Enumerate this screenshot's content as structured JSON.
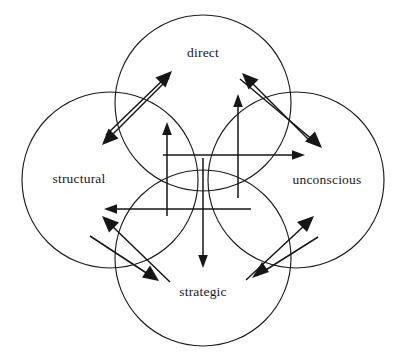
{
  "diagram": {
    "background_color": "#ffffff",
    "stroke_color": "#1c1c1c",
    "arrow_color": "#161616",
    "label_color": "#20201e",
    "circles": [
      {
        "id": "top",
        "label": "direct",
        "cx": 203,
        "cy": 103,
        "r": 88,
        "label_x": 203,
        "label_y": 54
      },
      {
        "id": "left",
        "label": "structural",
        "cx": 110,
        "cy": 180,
        "r": 88,
        "label_x": 79,
        "label_y": 180
      },
      {
        "id": "right",
        "label": "unconscious",
        "cx": 296,
        "cy": 180,
        "r": 88,
        "label_x": 327,
        "label_y": 181
      },
      {
        "id": "bottom",
        "label": "strategic",
        "cx": 203,
        "cy": 258,
        "r": 88,
        "label_x": 203,
        "label_y": 293
      }
    ],
    "axis_arrows": [
      {
        "id": "up-left-axis",
        "direction": "up",
        "x1": 167,
        "y1": 216,
        "x2": 167,
        "y2": 124
      },
      {
        "id": "up-right-axis",
        "direction": "up",
        "x1": 238,
        "y1": 198,
        "x2": 238,
        "y2": 96
      },
      {
        "id": "down-axis",
        "direction": "down",
        "x1": 203,
        "y1": 158,
        "x2": 203,
        "y2": 266
      },
      {
        "id": "right-axis",
        "direction": "right",
        "x1": 163,
        "y1": 155,
        "x2": 303,
        "y2": 155
      },
      {
        "id": "left-axis",
        "direction": "left",
        "x1": 251,
        "y1": 209,
        "x2": 106,
        "y2": 209
      }
    ],
    "diagonal_arrows": [
      {
        "id": "structural-to-direct",
        "x1": 106,
        "y1": 135,
        "x2": 171,
        "y2": 72
      },
      {
        "id": "direct-to-structural",
        "x1": 169,
        "y1": 78,
        "x2": 103,
        "y2": 144
      },
      {
        "id": "unconscious-to-direct",
        "x1": 309,
        "y1": 140,
        "x2": 243,
        "y2": 74
      },
      {
        "id": "direct-to-unconscious",
        "x1": 240,
        "y1": 79,
        "x2": 321,
        "y2": 147
      },
      {
        "id": "strategic-to-structural",
        "x1": 170,
        "y1": 282,
        "x2": 103,
        "y2": 217
      },
      {
        "id": "structural-to-strategic",
        "x1": 90,
        "y1": 236,
        "x2": 157,
        "y2": 280
      },
      {
        "id": "strategic-to-unconscious",
        "x1": 246,
        "y1": 280,
        "x2": 312,
        "y2": 218
      },
      {
        "id": "unconscious-to-strategic",
        "x1": 318,
        "y1": 237,
        "x2": 254,
        "y2": 277
      }
    ]
  }
}
